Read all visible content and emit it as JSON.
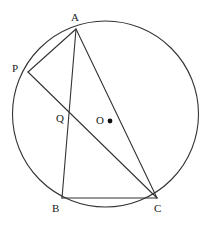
{
  "figure": {
    "type": "euclidean-geometry-diagram",
    "canvas": {
      "width": 215,
      "height": 230,
      "background": "#ffffff"
    },
    "stroke_color": "#333333",
    "label_color": "#1a1a1a",
    "circle": {
      "name": "circumscribed-circle",
      "cx": 105.5,
      "cy": 114,
      "r": 93,
      "stroke_width": 1.1
    },
    "center_dot": {
      "name": "center-point-marker",
      "cx": 110,
      "cy": 121,
      "r": 2.4,
      "fill": "#111111"
    },
    "points": [
      {
        "id": "A",
        "label": "A",
        "x": 76,
        "y": 29,
        "label_x": 71,
        "label_y": 12
      },
      {
        "id": "P",
        "label": "P",
        "x": 28,
        "y": 72,
        "label_x": 12,
        "label_y": 63
      },
      {
        "id": "Q",
        "label": "Q",
        "x": 70,
        "y": 110,
        "label_x": 56,
        "label_y": 113
      },
      {
        "id": "O",
        "label": "O",
        "x": 110,
        "y": 121,
        "label_x": 96,
        "label_y": 115
      },
      {
        "id": "B",
        "label": "B",
        "x": 62,
        "y": 198,
        "label_x": 52,
        "label_y": 203
      },
      {
        "id": "C",
        "label": "C",
        "x": 157,
        "y": 198,
        "label_x": 154,
        "label_y": 203
      }
    ],
    "segments": [
      {
        "name": "segment-AP",
        "from": "A",
        "to": "P",
        "x1": 76,
        "y1": 29,
        "x2": 28,
        "y2": 72
      },
      {
        "name": "segment-AB",
        "from": "A",
        "to": "B",
        "x1": 76,
        "y1": 29,
        "x2": 62,
        "y2": 198
      },
      {
        "name": "segment-AC",
        "from": "A",
        "to": "C",
        "x1": 76,
        "y1": 29,
        "x2": 157,
        "y2": 198
      },
      {
        "name": "segment-PC",
        "from": "P",
        "to": "C",
        "x1": 28,
        "y1": 72,
        "x2": 157,
        "y2": 198
      },
      {
        "name": "segment-BC",
        "from": "B",
        "to": "C",
        "x1": 62,
        "y1": 198,
        "x2": 157,
        "y2": 198
      }
    ]
  }
}
